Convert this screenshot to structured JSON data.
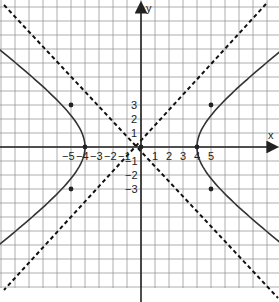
{
  "chart_data": {
    "type": "line",
    "title": "",
    "xlabel": "x",
    "ylabel": "y",
    "equation_hint": "hyperbola x^2/16 - y^2/9 = 1 with dashed asymptotes",
    "x_tick_labels": [
      "-5",
      "-4",
      "-3",
      "-2",
      "-1",
      "1",
      "2",
      "3",
      "4",
      "5"
    ],
    "y_tick_labels": [
      "3",
      "2",
      "1",
      "-1",
      "-2",
      "-3"
    ],
    "grid": true,
    "xlim": [
      -10,
      10
    ],
    "ylim": [
      -10.5,
      10.5
    ],
    "series": [
      {
        "name": "hyperbola-right-branch",
        "style": "solid",
        "vertex": [
          4,
          0
        ]
      },
      {
        "name": "hyperbola-left-branch",
        "style": "solid",
        "vertex": [
          -4,
          0
        ]
      },
      {
        "name": "asymptote-1",
        "style": "dashed"
      },
      {
        "name": "asymptote-2",
        "style": "dashed"
      }
    ],
    "marked_points": [
      [
        5,
        3
      ],
      [
        5,
        -3
      ],
      [
        -5,
        3
      ],
      [
        -5,
        -3
      ],
      [
        4,
        0
      ],
      [
        -4,
        0
      ],
      [
        0,
        0
      ]
    ]
  },
  "axes": {
    "x_label": "x",
    "y_label": "y"
  }
}
